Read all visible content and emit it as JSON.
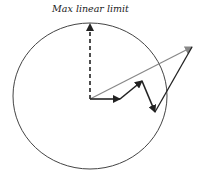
{
  "diagram": {
    "label": "Max linear limit",
    "colors": {
      "circle": "#444444",
      "arrows": "#222222",
      "resultant": "#888888"
    }
  }
}
